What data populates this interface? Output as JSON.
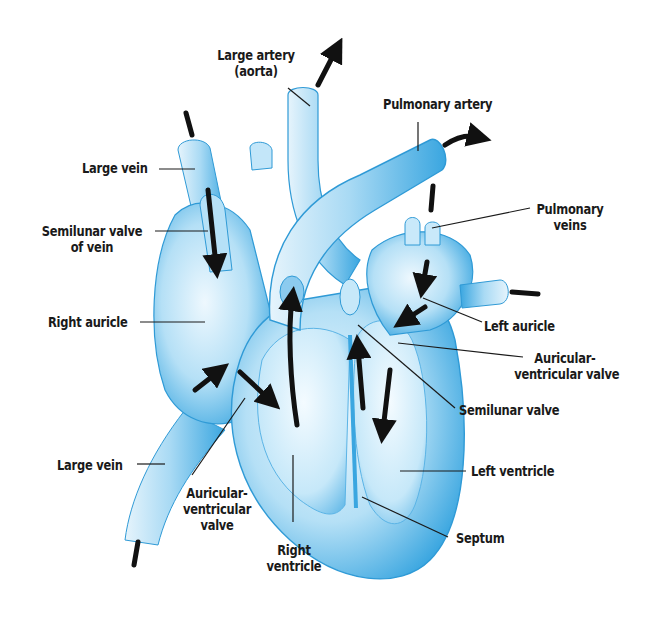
{
  "diagram": {
    "colors": {
      "heart_light": "#d8eefa",
      "heart_mid": "#8ccbef",
      "heart_dark": "#3aa6e0",
      "outline": "#2f9ad6",
      "arrow": "#111111",
      "leader_line": "#1a1a1a",
      "background": "#ffffff"
    },
    "labels": {
      "large_artery": {
        "line1": "Large artery",
        "line2": "(aorta)"
      },
      "pulmonary_artery": {
        "line1": "Pulmonary artery"
      },
      "large_vein_top": {
        "line1": "Large vein"
      },
      "semilunar_valve_of_vein": {
        "line1": "Semilunar valve",
        "line2": "of vein"
      },
      "pulmonary_veins": {
        "line1": "Pulmonary",
        "line2": "veins"
      },
      "right_auricle": {
        "line1": "Right auricle"
      },
      "left_auricle": {
        "line1": "Left auricle"
      },
      "av_valve_right_side": {
        "line1": "Auricular-",
        "line2": "ventricular valve"
      },
      "semilunar_valve": {
        "line1": "Semilunar valve"
      },
      "left_ventricle": {
        "line1": "Left ventricle"
      },
      "large_vein_bottom": {
        "line1": "Large vein"
      },
      "av_valve_left_side": {
        "line1": "Auricular-",
        "line2": "ventricular",
        "line3": "valve"
      },
      "right_ventricle": {
        "line1": "Right",
        "line2": "ventricle"
      },
      "septum": {
        "line1": "Septum"
      }
    },
    "flow_arrows": [
      "into large vein (top)",
      "out of aorta",
      "out of pulmonary artery",
      "into pulmonary veins (top)",
      "into pulmonary veins (right)",
      "down through semilunar valve of vein",
      "right auricle to right ventricle",
      "right ventricle up to pulmonary artery",
      "left auricle to left ventricle",
      "left ventricle up to aorta",
      "into large vein (bottom)"
    ]
  }
}
